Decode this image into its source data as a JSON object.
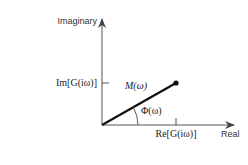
{
  "diagram": {
    "type": "complex-plane-phasor",
    "axes": {
      "y_label": "Imaginary",
      "x_label": "Real"
    },
    "ticks": {
      "im_label": "Im[G(iω)]",
      "re_label": "Re[G(iω)]"
    },
    "vector": {
      "magnitude_label": "M(ω)",
      "angle_label": "Φ(ω)"
    },
    "colors": {
      "axis": "#555555",
      "vector": "#111111",
      "text": "#333333"
    }
  }
}
